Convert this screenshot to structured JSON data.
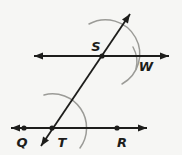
{
  "diagram": {
    "background_color": "#f6f6f4",
    "line_color": "#1d1d1b",
    "arc_color": "#9b9b97",
    "label_color": "#1d1d1b",
    "lines": [
      {
        "name": "upper-parallel-line",
        "x1": 34,
        "y1": 56,
        "x2": 169,
        "y2": 56,
        "arrow_start": true,
        "arrow_end": true
      },
      {
        "name": "lower-parallel-line",
        "x1": 11,
        "y1": 128,
        "x2": 147,
        "y2": 128,
        "arrow_start": true,
        "arrow_end": true
      },
      {
        "name": "transversal-line",
        "x1": 41,
        "y1": 146,
        "x2": 130,
        "y2": 14,
        "arrow_start": true,
        "arrow_end": true
      }
    ],
    "arcs": [
      {
        "name": "compass-arc-upper",
        "d": "M 89 24 A 34 34 0 0 1 122 84"
      },
      {
        "name": "compass-arc-lower",
        "d": "M 44 95 A 34 34 0 0 1 80 148"
      },
      {
        "name": "tick-arc-W",
        "d": "M 133 47 Q 139 58 136 69"
      }
    ],
    "points": [
      {
        "name": "S",
        "x": 102,
        "y": 56
      },
      {
        "name": "Q",
        "x": 24,
        "y": 128
      },
      {
        "name": "T",
        "x": 52,
        "y": 128
      },
      {
        "name": "R",
        "x": 117,
        "y": 128
      }
    ],
    "labels": [
      {
        "text": "S",
        "x": 96,
        "y": 51
      },
      {
        "text": "W",
        "x": 146,
        "y": 71
      },
      {
        "text": "Q",
        "x": 22,
        "y": 147
      },
      {
        "text": "T",
        "x": 62,
        "y": 147
      },
      {
        "text": "R",
        "x": 122,
        "y": 147
      }
    ]
  }
}
